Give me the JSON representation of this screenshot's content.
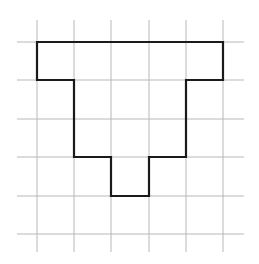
{
  "diagram": {
    "type": "grid-polyomino",
    "grid": {
      "columns": 6,
      "rows": 6,
      "vertical_lines_x": [
        37,
        74,
        111,
        149,
        186,
        223
      ],
      "horizontal_lines_y": [
        42,
        80,
        119,
        157,
        196,
        234
      ],
      "line_extent": {
        "x_min": 17,
        "x_max": 244,
        "y_min": 20,
        "y_max": 252
      },
      "line_color": "#b8b8b8"
    },
    "shape": {
      "description": "T-like polyomino outlined in black on square grid",
      "outline_color": "#1a1a1a",
      "cells": [
        [
          0,
          0
        ],
        [
          1,
          0
        ],
        [
          2,
          0
        ],
        [
          3,
          0
        ],
        [
          4,
          0
        ],
        [
          1,
          1
        ],
        [
          2,
          1
        ],
        [
          3,
          1
        ],
        [
          1,
          2
        ],
        [
          2,
          2
        ],
        [
          3,
          2
        ],
        [
          2,
          3
        ]
      ],
      "cell_count": 12,
      "vertices_grid": [
        [
          0,
          0
        ],
        [
          5,
          0
        ],
        [
          5,
          1
        ],
        [
          4,
          1
        ],
        [
          4,
          3
        ],
        [
          3,
          3
        ],
        [
          3,
          4
        ],
        [
          2,
          4
        ],
        [
          2,
          3
        ],
        [
          1,
          3
        ],
        [
          1,
          1
        ],
        [
          0,
          1
        ]
      ]
    }
  }
}
